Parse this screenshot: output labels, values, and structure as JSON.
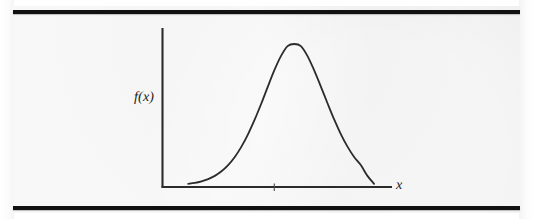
{
  "figure": {
    "kind": "textbook-figure",
    "caption_rule_top": "horizontal-rule",
    "caption_rule_bottom": "horizontal-rule",
    "background_color": "#efefef",
    "ink_color": "#2b2b2b",
    "rule_color": "#111111"
  },
  "labels": {
    "y_axis": "f(x)",
    "x_axis": "x"
  },
  "chart_data": {
    "type": "line",
    "title": "",
    "subtitle": "",
    "xlabel": "x",
    "ylabel": "f(x)",
    "grid": false,
    "legend": false,
    "legend_position": "none",
    "axis_style": "L-shaped (left spine and bottom spine only)",
    "xlim": [
      0,
      1
    ],
    "ylim": [
      0,
      1
    ],
    "x_tick_labels": [],
    "y_tick_labels": [],
    "annotations": [
      {
        "name": "center-tick",
        "type": "tick-mark",
        "x": 0.487,
        "label": "",
        "note": "short unlabeled tick on the x-axis beneath the curve peak (the mean)"
      }
    ],
    "series": [
      {
        "name": "normal density curve",
        "description": "symmetric bell-shaped probability density function",
        "color": "#2b2b2b",
        "line_width": 1.8,
        "peak": {
          "x": 0.487,
          "y": 0.9
        },
        "x": [
          0.112,
          0.141,
          0.17,
          0.199,
          0.228,
          0.257,
          0.286,
          0.315,
          0.344,
          0.373,
          0.402,
          0.431,
          0.459,
          0.487,
          0.516,
          0.545,
          0.574,
          0.603,
          0.632,
          0.661,
          0.69,
          0.719,
          0.748,
          0.777,
          0.806,
          0.835,
          0.864,
          0.893,
          0.922
        ],
        "y": [
          0.02,
          0.026,
          0.036,
          0.05,
          0.07,
          0.099,
          0.138,
          0.189,
          0.254,
          0.333,
          0.425,
          0.527,
          0.632,
          0.734,
          0.824,
          0.887,
          0.9,
          0.887,
          0.824,
          0.734,
          0.632,
          0.527,
          0.425,
          0.333,
          0.254,
          0.189,
          0.138,
          0.07,
          0.02
        ]
      }
    ]
  }
}
